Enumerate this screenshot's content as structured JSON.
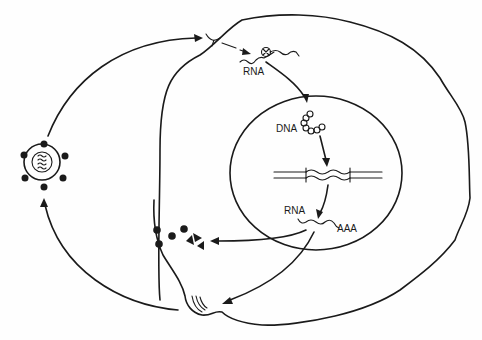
{
  "diagram": {
    "colors": {
      "ink": "#1a1a1a",
      "background": "#fefefe"
    },
    "labels": {
      "rna_entry": "RNA",
      "dna_nucleus": "DNA",
      "rna_transcript": "RNA",
      "poly_a": "AAA"
    },
    "nodes": [
      {
        "id": "virion",
        "name": "virus particle"
      },
      {
        "id": "receptor",
        "name": "cell surface receptor"
      },
      {
        "id": "uncoated-rna",
        "name": "viral RNA with reverse transcriptase"
      },
      {
        "id": "proviral-dna",
        "name": "circular DNA"
      },
      {
        "id": "integrated-provirus",
        "name": "integrated provirus in host DNA"
      },
      {
        "id": "mrna",
        "name": "viral RNA transcript"
      },
      {
        "id": "proteins",
        "name": "viral proteins"
      },
      {
        "id": "budding-site",
        "name": "budding at membrane"
      }
    ]
  }
}
